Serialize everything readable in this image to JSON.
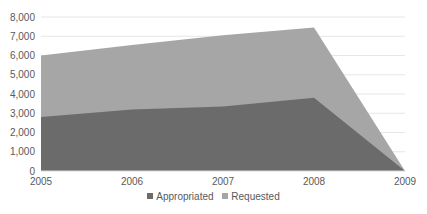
{
  "chart_data": {
    "type": "area",
    "title": "",
    "xlabel": "",
    "ylabel": "",
    "categories": [
      "2005",
      "2006",
      "2007",
      "2008",
      "2009"
    ],
    "series": [
      {
        "name": "Appropriated",
        "values": [
          2800,
          3200,
          3350,
          3800,
          0
        ],
        "color": "#6b6b6b"
      },
      {
        "name": "Requested",
        "values": [
          6000,
          6550,
          7050,
          7450,
          0
        ],
        "color": "#a6a6a6"
      }
    ],
    "ylim": [
      0,
      8000
    ],
    "yticks": [
      "0",
      "1,000",
      "2,000",
      "3,000",
      "4,000",
      "5,000",
      "6,000",
      "7,000",
      "8,000"
    ],
    "grid": true,
    "legend_position": "bottom"
  },
  "legend": {
    "items": [
      {
        "label": "Appropriated",
        "color": "#6b6b6b"
      },
      {
        "label": "Requested",
        "color": "#a6a6a6"
      }
    ]
  }
}
